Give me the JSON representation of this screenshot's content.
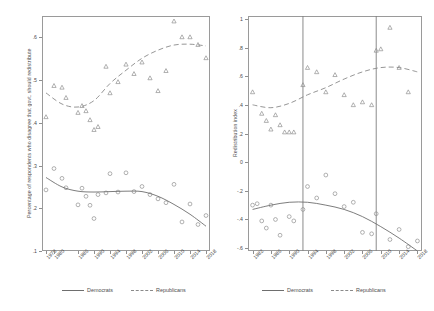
{
  "figure": {
    "panels": [
      {
        "id": "left",
        "ylabel": "Percentage of respondents who disagree that govt. should redistribute",
        "yticks": [
          ".6",
          ".5",
          ".4",
          ".3",
          ".2",
          ".1"
        ],
        "ytick_values": [
          0.6,
          0.5,
          0.4,
          0.3,
          0.2,
          0.1
        ],
        "xticks": [
          "1978",
          "1980",
          "1986",
          "1990",
          "1994",
          "1998",
          "2002",
          "2006",
          "2010",
          "2014",
          "2018"
        ],
        "xtick_values": [
          1978,
          1980,
          1986,
          1990,
          1994,
          1998,
          2002,
          2006,
          2010,
          2014,
          2018
        ],
        "vlines": [],
        "legend": [
          {
            "label": "Democrats",
            "style": "solid"
          },
          {
            "label": "Republicans",
            "style": "dashed"
          }
        ]
      },
      {
        "id": "right",
        "ylabel": "Redistribution index",
        "yticks": [
          "1",
          ".8",
          ".6",
          ".4",
          ".2",
          "0",
          "-.2",
          "-.4",
          "-.6"
        ],
        "ytick_values": [
          1,
          0.8,
          0.6,
          0.4,
          0.2,
          0,
          -0.2,
          -0.4,
          -0.6
        ],
        "xticks": [
          "1982",
          "1986",
          "1990",
          "1994",
          "1998",
          "2002",
          "2006",
          "2010",
          "2014",
          "2018"
        ],
        "xtick_values": [
          1982,
          1986,
          1990,
          1994,
          1998,
          2002,
          2006,
          2010,
          2014,
          2018
        ],
        "vlines": [
          1993,
          2009
        ],
        "legend": [
          {
            "label": "Democrats",
            "style": "solid"
          },
          {
            "label": "Republicans",
            "style": "dashed"
          }
        ]
      }
    ]
  },
  "chart_data": [
    {
      "type": "scatter",
      "panel": "left",
      "title": "",
      "xlabel": "",
      "ylabel": "Percentage of respondents who disagree that govt. should redistribute",
      "xlim": [
        1977,
        2019
      ],
      "ylim": [
        0.1,
        0.65
      ],
      "grid": false,
      "legend_position": "bottom",
      "series": [
        {
          "name": "Republicans",
          "marker": "triangle",
          "line": "dashed",
          "points": [
            {
              "x": 1978,
              "y": 0.414
            },
            {
              "x": 1980,
              "y": 0.487
            },
            {
              "x": 1982,
              "y": 0.483
            },
            {
              "x": 1983,
              "y": 0.459
            },
            {
              "x": 1986,
              "y": 0.424
            },
            {
              "x": 1987,
              "y": 0.44
            },
            {
              "x": 1988,
              "y": 0.428
            },
            {
              "x": 1989,
              "y": 0.407
            },
            {
              "x": 1990,
              "y": 0.384
            },
            {
              "x": 1991,
              "y": 0.391
            },
            {
              "x": 1993,
              "y": 0.532
            },
            {
              "x": 1994,
              "y": 0.47
            },
            {
              "x": 1996,
              "y": 0.496
            },
            {
              "x": 1998,
              "y": 0.537
            },
            {
              "x": 2000,
              "y": 0.515
            },
            {
              "x": 2002,
              "y": 0.542
            },
            {
              "x": 2004,
              "y": 0.505
            },
            {
              "x": 2006,
              "y": 0.475
            },
            {
              "x": 2008,
              "y": 0.522
            },
            {
              "x": 2010,
              "y": 0.638
            },
            {
              "x": 2012,
              "y": 0.601
            },
            {
              "x": 2014,
              "y": 0.601
            },
            {
              "x": 2016,
              "y": 0.583
            },
            {
              "x": 2018,
              "y": 0.552
            }
          ],
          "fit": [
            {
              "x": 1978,
              "y": 0.47
            },
            {
              "x": 1982,
              "y": 0.444
            },
            {
              "x": 1986,
              "y": 0.437
            },
            {
              "x": 1990,
              "y": 0.452
            },
            {
              "x": 1994,
              "y": 0.492
            },
            {
              "x": 1998,
              "y": 0.523
            },
            {
              "x": 2002,
              "y": 0.551
            },
            {
              "x": 2006,
              "y": 0.57
            },
            {
              "x": 2010,
              "y": 0.582
            },
            {
              "x": 2014,
              "y": 0.584
            },
            {
              "x": 2018,
              "y": 0.58
            }
          ]
        },
        {
          "name": "Democrats",
          "marker": "circle",
          "line": "solid",
          "points": [
            {
              "x": 1978,
              "y": 0.243
            },
            {
              "x": 1980,
              "y": 0.293
            },
            {
              "x": 1982,
              "y": 0.27
            },
            {
              "x": 1983,
              "y": 0.248
            },
            {
              "x": 1986,
              "y": 0.208
            },
            {
              "x": 1987,
              "y": 0.247
            },
            {
              "x": 1988,
              "y": 0.228
            },
            {
              "x": 1989,
              "y": 0.207
            },
            {
              "x": 1990,
              "y": 0.176
            },
            {
              "x": 1991,
              "y": 0.232
            },
            {
              "x": 1993,
              "y": 0.236
            },
            {
              "x": 1994,
              "y": 0.281
            },
            {
              "x": 1996,
              "y": 0.238
            },
            {
              "x": 1998,
              "y": 0.283
            },
            {
              "x": 2000,
              "y": 0.239
            },
            {
              "x": 2002,
              "y": 0.251
            },
            {
              "x": 2004,
              "y": 0.232
            },
            {
              "x": 2006,
              "y": 0.222
            },
            {
              "x": 2008,
              "y": 0.213
            },
            {
              "x": 2010,
              "y": 0.256
            },
            {
              "x": 2012,
              "y": 0.168
            },
            {
              "x": 2014,
              "y": 0.21
            },
            {
              "x": 2016,
              "y": 0.162
            },
            {
              "x": 2018,
              "y": 0.183
            }
          ],
          "fit": [
            {
              "x": 1978,
              "y": 0.272
            },
            {
              "x": 1982,
              "y": 0.25
            },
            {
              "x": 1986,
              "y": 0.24
            },
            {
              "x": 1990,
              "y": 0.238
            },
            {
              "x": 1994,
              "y": 0.239
            },
            {
              "x": 1998,
              "y": 0.24
            },
            {
              "x": 2002,
              "y": 0.239
            },
            {
              "x": 2006,
              "y": 0.228
            },
            {
              "x": 2010,
              "y": 0.209
            },
            {
              "x": 2014,
              "y": 0.186
            },
            {
              "x": 2018,
              "y": 0.158
            }
          ]
        }
      ]
    },
    {
      "type": "scatter",
      "panel": "right",
      "title": "",
      "xlabel": "",
      "ylabel": "Redistribution index",
      "xlim": [
        1981,
        2019
      ],
      "ylim": [
        -0.62,
        1.02
      ],
      "grid": false,
      "legend_position": "bottom",
      "vlines": [
        1993,
        2009
      ],
      "series": [
        {
          "name": "Republicans",
          "marker": "triangle",
          "line": "dashed",
          "points": [
            {
              "x": 1982,
              "y": 0.49
            },
            {
              "x": 1984,
              "y": 0.34
            },
            {
              "x": 1985,
              "y": 0.29
            },
            {
              "x": 1986,
              "y": 0.23
            },
            {
              "x": 1987,
              "y": 0.33
            },
            {
              "x": 1988,
              "y": 0.26
            },
            {
              "x": 1989,
              "y": 0.21
            },
            {
              "x": 1990,
              "y": 0.21
            },
            {
              "x": 1991,
              "y": 0.21
            },
            {
              "x": 1993,
              "y": 0.54
            },
            {
              "x": 1994,
              "y": 0.66
            },
            {
              "x": 1996,
              "y": 0.63
            },
            {
              "x": 1998,
              "y": 0.49
            },
            {
              "x": 2000,
              "y": 0.61
            },
            {
              "x": 2002,
              "y": 0.47
            },
            {
              "x": 2004,
              "y": 0.4
            },
            {
              "x": 2006,
              "y": 0.42
            },
            {
              "x": 2008,
              "y": 0.4
            },
            {
              "x": 2009,
              "y": 0.78
            },
            {
              "x": 2010,
              "y": 0.79
            },
            {
              "x": 2012,
              "y": 0.94
            },
            {
              "x": 2014,
              "y": 0.66
            },
            {
              "x": 2016,
              "y": 0.49
            }
          ],
          "fit": [
            {
              "x": 1982,
              "y": 0.4
            },
            {
              "x": 1986,
              "y": 0.38
            },
            {
              "x": 1990,
              "y": 0.41
            },
            {
              "x": 1994,
              "y": 0.47
            },
            {
              "x": 1998,
              "y": 0.52
            },
            {
              "x": 2002,
              "y": 0.58
            },
            {
              "x": 2006,
              "y": 0.63
            },
            {
              "x": 2010,
              "y": 0.66
            },
            {
              "x": 2014,
              "y": 0.66
            },
            {
              "x": 2018,
              "y": 0.63
            }
          ]
        },
        {
          "name": "Democrats",
          "marker": "circle",
          "line": "solid",
          "points": [
            {
              "x": 1982,
              "y": -0.3
            },
            {
              "x": 1983,
              "y": -0.29
            },
            {
              "x": 1984,
              "y": -0.41
            },
            {
              "x": 1985,
              "y": -0.46
            },
            {
              "x": 1986,
              "y": -0.3
            },
            {
              "x": 1987,
              "y": -0.4
            },
            {
              "x": 1988,
              "y": -0.51
            },
            {
              "x": 1990,
              "y": -0.38
            },
            {
              "x": 1991,
              "y": -0.41
            },
            {
              "x": 1993,
              "y": -0.33
            },
            {
              "x": 1994,
              "y": -0.17
            },
            {
              "x": 1996,
              "y": -0.25
            },
            {
              "x": 1998,
              "y": -0.09
            },
            {
              "x": 2000,
              "y": -0.22
            },
            {
              "x": 2002,
              "y": -0.31
            },
            {
              "x": 2004,
              "y": -0.28
            },
            {
              "x": 2006,
              "y": -0.49
            },
            {
              "x": 2008,
              "y": -0.5
            },
            {
              "x": 2009,
              "y": -0.36
            },
            {
              "x": 2012,
              "y": -0.54
            },
            {
              "x": 2014,
              "y": -0.47
            },
            {
              "x": 2016,
              "y": -0.59
            },
            {
              "x": 2018,
              "y": -0.55
            }
          ],
          "fit": [
            {
              "x": 1982,
              "y": -0.33
            },
            {
              "x": 1986,
              "y": -0.3
            },
            {
              "x": 1990,
              "y": -0.28
            },
            {
              "x": 1994,
              "y": -0.28
            },
            {
              "x": 1998,
              "y": -0.3
            },
            {
              "x": 2002,
              "y": -0.33
            },
            {
              "x": 2006,
              "y": -0.38
            },
            {
              "x": 2010,
              "y": -0.45
            },
            {
              "x": 2014,
              "y": -0.53
            },
            {
              "x": 2018,
              "y": -0.62
            }
          ]
        }
      ]
    }
  ]
}
